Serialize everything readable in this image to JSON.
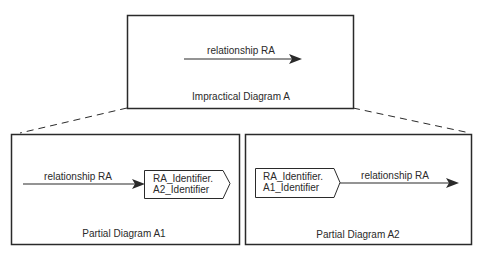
{
  "diagram": {
    "top": {
      "title": "Impractical Diagram A",
      "relationship_label": "relationship RA"
    },
    "left": {
      "title": "Partial Diagram A1",
      "relationship_label": "relationship RA",
      "identifier_line1": "RA_Identifier.",
      "identifier_line2": "A2_Identifier"
    },
    "right": {
      "title": "Partial Diagram A2",
      "relationship_label": "relationship RA",
      "identifier_line1": "RA_Identifier.",
      "identifier_line2": "A1_Identifier"
    },
    "colors": {
      "stroke": "#2a2a2a",
      "background": "#ffffff"
    }
  }
}
